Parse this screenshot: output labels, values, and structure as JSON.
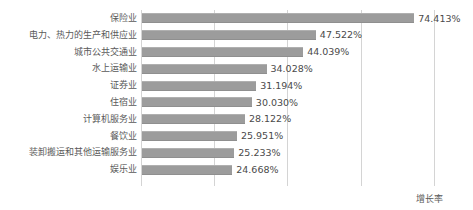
{
  "chart_data": {
    "type": "bar",
    "orientation": "horizontal",
    "title": "",
    "xlabel": "增长率",
    "ylabel": "",
    "legend": [
      "增长率"
    ],
    "legend_position": "bottom-right",
    "grid": true,
    "gridlines_x": [
      20,
      40,
      60,
      80
    ],
    "xlim": [
      0,
      85
    ],
    "value_suffix": "%",
    "categories": [
      "保险业",
      "电力、热力的生产和供应业",
      "城市公共交通业",
      "水上运输业",
      "证券业",
      "住宿业",
      "计算机服务业",
      "餐饮业",
      "装卸搬运和其他运输服务业",
      "娱乐业"
    ],
    "values": [
      74.413,
      47.522,
      44.039,
      34.028,
      31.194,
      30.03,
      28.122,
      25.951,
      25.233,
      24.668
    ],
    "value_labels": [
      "74.413%",
      "47.522%",
      "44.039%",
      "34.028%",
      "31.194%",
      "30.030%",
      "28.122%",
      "25.951%",
      "25.233%",
      "24.668%"
    ],
    "bar_color": "#9a9a9a",
    "grid_color": "#d4d4d4",
    "text_color": "#5a5a5a"
  },
  "axis": {
    "growth_rate_label": "增长率"
  }
}
